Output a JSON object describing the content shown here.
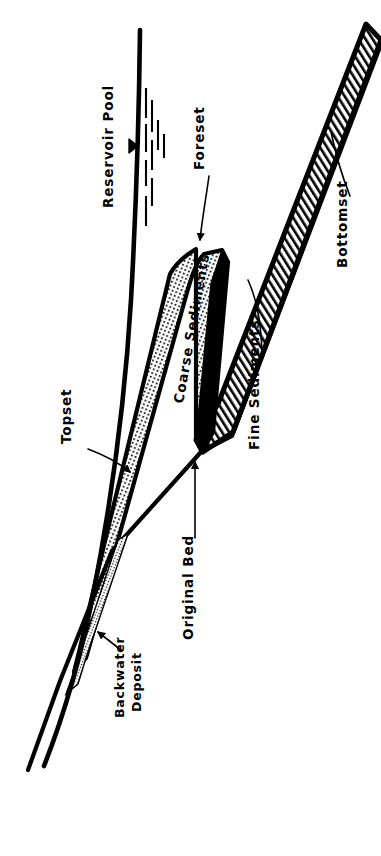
{
  "figure": {
    "orientation": "rotated-90-ccw",
    "background_color": "#ffffff",
    "ink_color": "#000000"
  },
  "labels": {
    "reservoir_pool": "Reservoir Pool",
    "foreset": "Foreset",
    "bottomset": "Bottomset",
    "topset": "Topset",
    "coarse_sediments": "Coarse Sediments",
    "fine_sediments": "Fine Sediments",
    "original_bed": "Original Bed",
    "backwater_deposit_line1": "Backwater",
    "backwater_deposit_line2": "Deposit"
  },
  "features": [
    {
      "name": "reservoir-pool-surface",
      "label": "Reservoir Pool",
      "kind": "water-surface-line",
      "symbol": "triangle-and-ticks"
    },
    {
      "name": "topset-bed",
      "label": "Topset",
      "kind": "delta-bed",
      "fill": "stipple"
    },
    {
      "name": "foreset-bed",
      "label": "Foreset",
      "kind": "delta-bed",
      "fill": "stipple"
    },
    {
      "name": "bottomset-bed",
      "label": "Bottomset",
      "kind": "delta-bed",
      "fill": "diagonal-hatch"
    },
    {
      "name": "coarse-sediments-body",
      "label": "Coarse Sediments",
      "kind": "sediment-body",
      "fill": "stipple"
    },
    {
      "name": "fine-sediments-body",
      "label": "Fine Sediments",
      "kind": "sediment-body",
      "fill": "diagonal-hatch"
    },
    {
      "name": "original-bed-line",
      "label": "Original Bed",
      "kind": "reference-line",
      "fill": "none"
    },
    {
      "name": "backwater-deposit",
      "label": "Backwater Deposit",
      "kind": "sediment-body",
      "fill": "stipple-thin"
    }
  ],
  "colors": {
    "ink": "#000000",
    "paper": "#ffffff"
  }
}
